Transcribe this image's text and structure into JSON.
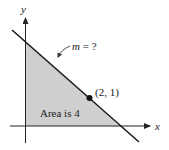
{
  "diagram": {
    "axes": {
      "x_label": "x",
      "y_label": "y"
    },
    "line": {
      "slope_label": "m = ?",
      "slope_var": "m",
      "slope_rest": " = ?"
    },
    "point": {
      "label": "(2, 1)",
      "x": 2,
      "y": 1
    },
    "region": {
      "label": "Area is 4",
      "fill_color": "#cfcfcf"
    },
    "colors": {
      "line": "#1a1a1a",
      "axis": "#222222"
    }
  }
}
